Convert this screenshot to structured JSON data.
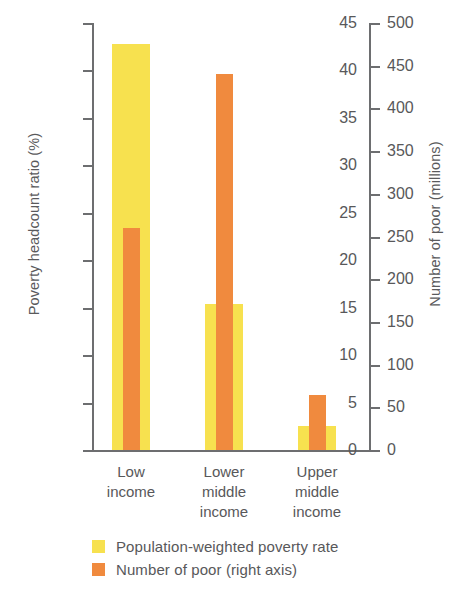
{
  "chart_data": {
    "type": "bar",
    "title": "",
    "subtitle": "",
    "xlabel": "",
    "categories": [
      "Low\nincome",
      "Lower\nmiddle\nincome",
      "Upper\nmiddle\nincome"
    ],
    "category_lines": [
      [
        "Low",
        "income"
      ],
      [
        "Lower",
        "middle",
        "income"
      ],
      [
        "Upper",
        "middle",
        "income"
      ]
    ],
    "grid": false,
    "legend_position": "bottom-left",
    "axes": {
      "left": {
        "label": "Poverty headcount ratio (%)",
        "ylim": [
          0,
          45
        ],
        "tick_step": 5,
        "ticks": [
          0,
          5,
          10,
          15,
          20,
          25,
          30,
          35,
          40,
          45
        ],
        "tick_labels": [
          "0",
          "5",
          "10",
          "15",
          "20",
          "25",
          "30",
          "35",
          "40",
          "45"
        ]
      },
      "right": {
        "label": "Number of poor (millions)",
        "ylim": [
          0,
          500
        ],
        "tick_step": 50,
        "ticks": [
          0,
          50,
          100,
          150,
          200,
          250,
          300,
          350,
          400,
          450,
          500
        ],
        "tick_labels": [
          "0",
          "50",
          "100",
          "150",
          "200",
          "250",
          "300",
          "350",
          "400",
          "450",
          "500"
        ]
      }
    },
    "series": [
      {
        "name": "Population-weighted poverty rate",
        "axis": "left",
        "color": "#F7E14F",
        "unit": "%",
        "values": [
          42.8,
          15.4,
          2.5
        ]
      },
      {
        "name": "Number of poor (right axis)",
        "axis": "right",
        "color": "#F08A3E",
        "unit": "millions",
        "values": [
          260,
          440,
          65
        ]
      }
    ]
  },
  "legend": {
    "items": [
      {
        "label": "Population-weighted poverty rate",
        "color": "#F7E14F"
      },
      {
        "label": "Number of poor (right axis)",
        "color": "#F08A3E"
      }
    ]
  },
  "colors": {
    "yellow": "#F7E14F",
    "orange": "#F08A3E",
    "axis": "#6d6e70",
    "text": "#58585a",
    "background": "#ffffff"
  }
}
